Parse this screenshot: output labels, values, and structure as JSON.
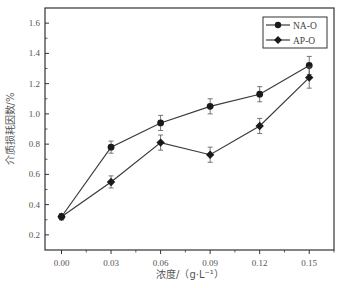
{
  "chart_data": {
    "type": "line",
    "title": "",
    "xlabel": "浓度/（g·L⁻¹）",
    "ylabel": "介质损耗因数/%",
    "x": [
      0.0,
      0.03,
      0.06,
      0.09,
      0.12,
      0.15
    ],
    "x_tick_labels": [
      "0.00",
      "0.03",
      "0.06",
      "0.09",
      "0.12",
      "0.15"
    ],
    "y_ticks": [
      0.2,
      0.4,
      0.6,
      0.8,
      1.0,
      1.2,
      1.4,
      1.6
    ],
    "y_tick_labels": [
      "0.2",
      "0.4",
      "0.6",
      "0.8",
      "1.0",
      "1.2",
      "1.4",
      "1.6"
    ],
    "xlim": [
      -0.01,
      0.165
    ],
    "ylim": [
      0.1,
      1.7
    ],
    "grid": false,
    "legend_position": "upper right",
    "series": [
      {
        "name": "NA-O",
        "marker": "circle",
        "values": [
          0.32,
          0.78,
          0.94,
          1.05,
          1.13,
          1.32
        ],
        "errors": [
          0.02,
          0.04,
          0.05,
          0.05,
          0.05,
          0.06
        ]
      },
      {
        "name": "AP-O",
        "marker": "diamond",
        "values": [
          0.32,
          0.55,
          0.81,
          0.73,
          0.92,
          1.24
        ],
        "errors": [
          0.02,
          0.04,
          0.05,
          0.05,
          0.05,
          0.07
        ]
      }
    ]
  },
  "colors": {
    "line": "#3a3a3a",
    "marker": "#1a1a1a",
    "axis": "#333333"
  }
}
